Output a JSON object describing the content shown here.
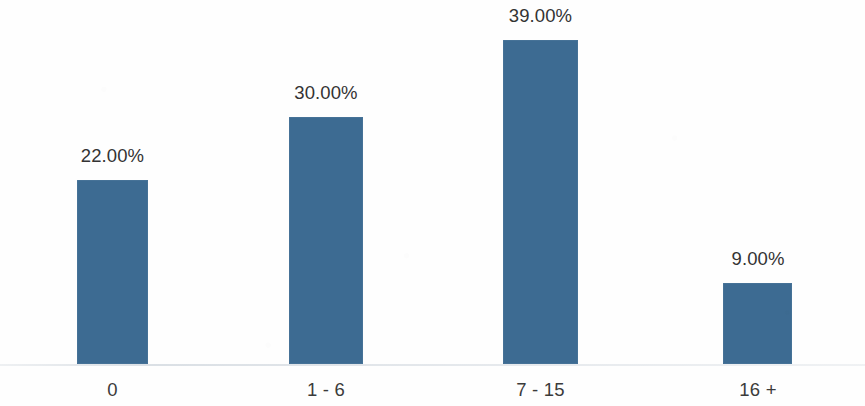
{
  "chart_data": {
    "type": "bar",
    "title": "",
    "subtitle": "",
    "xlabel": "",
    "ylabel": "",
    "categories": [
      "0",
      "1 - 6",
      "7 - 15",
      "16 +"
    ],
    "values": [
      22.0,
      30.0,
      39.0,
      9.0
    ],
    "value_labels": [
      "22.00%",
      "30.00%",
      "39.00%",
      "9.00%"
    ],
    "series": [
      {
        "name": "",
        "values": [
          22.0,
          30.0,
          39.0,
          9.0
        ]
      }
    ],
    "ylim": [
      0,
      39
    ],
    "grid": false,
    "legend": false,
    "legend_position": "none",
    "value_labels_shown": true,
    "axis_visible": true,
    "y_axis_visible": false,
    "y_tick_labels": [],
    "bar_color": "#3d6b92",
    "label_color": "#333333",
    "category_label_color": "#3b3b3b",
    "background_color": "#fefefe",
    "axis_line_color": "#c0c8d0"
  },
  "bars": [
    {
      "category": "0",
      "value_label": "22.00%",
      "left_px": 77,
      "width_px": 71,
      "top_px": 180,
      "height_px": 184,
      "label_left_px": 62,
      "label_top_px": 147,
      "label_width_px": 101,
      "cat_left_px": 62,
      "cat_top_px": 381,
      "cat_width_px": 101
    },
    {
      "category": "1 - 6",
      "value_label": "30.00%",
      "left_px": 289,
      "width_px": 74,
      "top_px": 117,
      "height_px": 247,
      "label_left_px": 275,
      "label_top_px": 84,
      "label_width_px": 102,
      "cat_left_px": 275,
      "cat_top_px": 381,
      "cat_width_px": 102
    },
    {
      "category": "7 - 15",
      "value_label": "39.00%",
      "left_px": 503,
      "width_px": 75,
      "top_px": 40,
      "height_px": 324,
      "label_left_px": 489,
      "label_top_px": 7,
      "label_width_px": 103,
      "cat_left_px": 489,
      "cat_top_px": 381,
      "cat_width_px": 103
    },
    {
      "category": "16 +",
      "value_label": "9.00%",
      "left_px": 723,
      "width_px": 69,
      "top_px": 283,
      "height_px": 81,
      "label_left_px": 714,
      "label_top_px": 250,
      "label_width_px": 88,
      "cat_left_px": 714,
      "cat_top_px": 381,
      "cat_width_px": 88
    }
  ],
  "axis": {
    "baseline_top_px": 364
  }
}
